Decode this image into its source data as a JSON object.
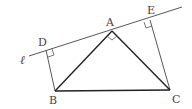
{
  "diagram": {
    "labels": {
      "line": "ℓ",
      "A": "A",
      "B": "B",
      "C": "C",
      "D": "D",
      "E": "E"
    },
    "points": {
      "A": [
        112,
        31
      ],
      "B": [
        55,
        91
      ],
      "C": [
        170,
        90
      ],
      "D": [
        46,
        50
      ],
      "E": [
        150,
        20
      ]
    },
    "line_l": {
      "start": [
        29,
        56
      ],
      "end": [
        182,
        7
      ]
    },
    "right_angles": [
      "D",
      "E",
      "A"
    ],
    "colors": {
      "stroke": "#333333",
      "label": "#444444"
    }
  }
}
